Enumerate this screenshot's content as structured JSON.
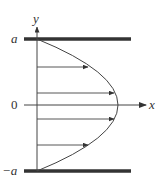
{
  "diagram": {
    "labels": {
      "y_axis": "y",
      "x_axis": "x",
      "top": "a",
      "origin": "0",
      "bottom": "−a"
    },
    "colors": {
      "plate": "#333333",
      "line": "#444444"
    },
    "arrows": [
      {
        "y_level": "upper",
        "length_fraction": 0.75
      },
      {
        "y_level": "mid-upper",
        "length_fraction": 0.96
      },
      {
        "y_level": "center",
        "length_fraction": 1.0
      },
      {
        "y_level": "mid-lower",
        "length_fraction": 0.96
      },
      {
        "y_level": "lower",
        "length_fraction": 0.75
      }
    ]
  }
}
